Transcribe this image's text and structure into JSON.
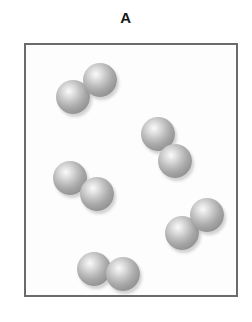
{
  "figure": {
    "panel_label": "A",
    "type": "particle-diagram",
    "container": {
      "x": 24,
      "y": 43,
      "width": 210,
      "height": 250,
      "border_color": "#6b6b6b",
      "border_width": 2,
      "fill_color": "#fdfdfd"
    },
    "atom_style": {
      "diameter": 33,
      "highlight_color": "#fbfbfb",
      "edge_color": "#858585",
      "shadow_color": "rgba(110,110,110,0.30)"
    },
    "molecule_count": 5,
    "atom_count": 10,
    "molecules": [
      {
        "name": "molecule-top-left",
        "atoms": [
          {
            "cx": 71,
            "cy": 95,
            "d": 34
          },
          {
            "cx": 98,
            "cy": 78,
            "d": 34
          }
        ]
      },
      {
        "name": "molecule-right-middle",
        "atoms": [
          {
            "cx": 156,
            "cy": 132,
            "d": 34
          },
          {
            "cx": 173,
            "cy": 159,
            "d": 34
          }
        ]
      },
      {
        "name": "molecule-left-middle",
        "atoms": [
          {
            "cx": 68,
            "cy": 176,
            "d": 34
          },
          {
            "cx": 95,
            "cy": 192,
            "d": 34
          }
        ]
      },
      {
        "name": "molecule-bottom-right",
        "atoms": [
          {
            "cx": 180,
            "cy": 231,
            "d": 34
          },
          {
            "cx": 205,
            "cy": 213,
            "d": 34
          }
        ]
      },
      {
        "name": "molecule-bottom-left",
        "atoms": [
          {
            "cx": 92,
            "cy": 267,
            "d": 34
          },
          {
            "cx": 121,
            "cy": 272,
            "d": 34
          }
        ]
      }
    ]
  }
}
